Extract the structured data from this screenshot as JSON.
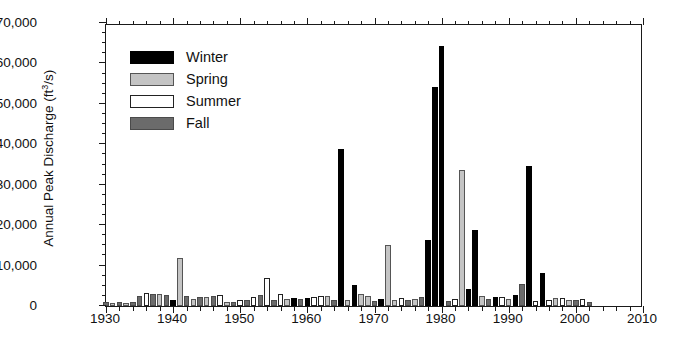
{
  "chart_data": {
    "type": "bar",
    "title": "",
    "xlabel": "",
    "ylabel": "Annual Peak Discharge (ft3/s)",
    "ylabel_main": "Annual Peak Discharge (ft",
    "ylabel_sup": "3",
    "ylabel_tail": "/s)",
    "xlim": [
      1930,
      2010
    ],
    "ylim": [
      0,
      70000
    ],
    "ytick_labels": [
      "0",
      "10,000",
      "20,000",
      "30,000",
      "40,000",
      "50,000",
      "60,000",
      "70,000"
    ],
    "ytick_values": [
      0,
      10000,
      20000,
      30000,
      40000,
      50000,
      60000,
      70000
    ],
    "ytick_minor_step": 2500,
    "xtick_labels": [
      "1930",
      "1940",
      "1950",
      "1960",
      "1970",
      "1980",
      "1990",
      "2000",
      "2010"
    ],
    "xtick_values": [
      1930,
      1940,
      1950,
      1960,
      1970,
      1980,
      1990,
      2000,
      2010
    ],
    "xtick_minor_step": 2,
    "grid": false,
    "legend_position": "upper-left",
    "legend": [
      {
        "name": "Winter",
        "color": "#000000",
        "border": "#000000"
      },
      {
        "name": "Spring",
        "color": "#c4c4c4",
        "border": "#555555"
      },
      {
        "name": "Summer",
        "color": "#ffffff",
        "border": "#222222"
      },
      {
        "name": "Fall",
        "color": "#6b6b6b",
        "border": "#4a4a4a"
      }
    ],
    "categories": [
      1930,
      1931,
      1932,
      1933,
      1934,
      1935,
      1936,
      1937,
      1938,
      1939,
      1940,
      1941,
      1942,
      1943,
      1944,
      1945,
      1946,
      1947,
      1948,
      1949,
      1950,
      1951,
      1952,
      1953,
      1954,
      1955,
      1956,
      1957,
      1958,
      1959,
      1960,
      1961,
      1962,
      1963,
      1964,
      1965,
      1966,
      1967,
      1968,
      1969,
      1970,
      1971,
      1972,
      1973,
      1974,
      1975,
      1976,
      1977,
      1978,
      1979,
      1980,
      1981,
      1982,
      1983,
      1984,
      1985,
      1986,
      1987,
      1988,
      1989,
      1990,
      1991,
      1992,
      1993,
      1994,
      1995,
      1996,
      1997,
      1998,
      1999,
      2000,
      2001,
      2002
    ],
    "points": [
      {
        "year": 1930,
        "value": 900,
        "season": "Fall"
      },
      {
        "year": 1931,
        "value": 700,
        "season": "Spring"
      },
      {
        "year": 1932,
        "value": 900,
        "season": "Fall"
      },
      {
        "year": 1933,
        "value": 800,
        "season": "Spring"
      },
      {
        "year": 1934,
        "value": 900,
        "season": "Fall"
      },
      {
        "year": 1935,
        "value": 2600,
        "season": "Fall"
      },
      {
        "year": 1936,
        "value": 3200,
        "season": "Summer"
      },
      {
        "year": 1937,
        "value": 3000,
        "season": "Fall"
      },
      {
        "year": 1938,
        "value": 3000,
        "season": "Spring"
      },
      {
        "year": 1939,
        "value": 2700,
        "season": "Fall"
      },
      {
        "year": 1940,
        "value": 1400,
        "season": "Winter"
      },
      {
        "year": 1941,
        "value": 11800,
        "season": "Spring"
      },
      {
        "year": 1942,
        "value": 2500,
        "season": "Fall"
      },
      {
        "year": 1943,
        "value": 1700,
        "season": "Spring"
      },
      {
        "year": 1944,
        "value": 2200,
        "season": "Fall"
      },
      {
        "year": 1945,
        "value": 2200,
        "season": "Spring"
      },
      {
        "year": 1946,
        "value": 2600,
        "season": "Fall"
      },
      {
        "year": 1947,
        "value": 2800,
        "season": "Summer"
      },
      {
        "year": 1948,
        "value": 1100,
        "season": "Spring"
      },
      {
        "year": 1949,
        "value": 1000,
        "season": "Fall"
      },
      {
        "year": 1950,
        "value": 1600,
        "season": "Summer"
      },
      {
        "year": 1951,
        "value": 1500,
        "season": "Fall"
      },
      {
        "year": 1952,
        "value": 2300,
        "season": "Summer"
      },
      {
        "year": 1953,
        "value": 2700,
        "season": "Fall"
      },
      {
        "year": 1954,
        "value": 7000,
        "season": "Summer"
      },
      {
        "year": 1955,
        "value": 1400,
        "season": "Fall"
      },
      {
        "year": 1956,
        "value": 3000,
        "season": "Summer"
      },
      {
        "year": 1957,
        "value": 1700,
        "season": "Spring"
      },
      {
        "year": 1958,
        "value": 1900,
        "season": "Winter"
      },
      {
        "year": 1959,
        "value": 1800,
        "season": "Fall"
      },
      {
        "year": 1960,
        "value": 2000,
        "season": "Winter"
      },
      {
        "year": 1961,
        "value": 2200,
        "season": "Summer"
      },
      {
        "year": 1962,
        "value": 2500,
        "season": "Summer"
      },
      {
        "year": 1963,
        "value": 2400,
        "season": "Spring"
      },
      {
        "year": 1964,
        "value": 1500,
        "season": "Fall"
      },
      {
        "year": 1965,
        "value": 38800,
        "season": "Winter"
      },
      {
        "year": 1966,
        "value": 1600,
        "season": "Spring"
      },
      {
        "year": 1967,
        "value": 5200,
        "season": "Winter"
      },
      {
        "year": 1968,
        "value": 3000,
        "season": "Spring"
      },
      {
        "year": 1969,
        "value": 2500,
        "season": "Spring"
      },
      {
        "year": 1970,
        "value": 1300,
        "season": "Fall"
      },
      {
        "year": 1971,
        "value": 1800,
        "season": "Winter"
      },
      {
        "year": 1972,
        "value": 15000,
        "season": "Spring"
      },
      {
        "year": 1973,
        "value": 1600,
        "season": "Spring"
      },
      {
        "year": 1974,
        "value": 2000,
        "season": "Summer"
      },
      {
        "year": 1975,
        "value": 1500,
        "season": "Fall"
      },
      {
        "year": 1976,
        "value": 1800,
        "season": "Spring"
      },
      {
        "year": 1977,
        "value": 2300,
        "season": "Fall"
      },
      {
        "year": 1978,
        "value": 16400,
        "season": "Winter"
      },
      {
        "year": 1979,
        "value": 54100,
        "season": "Winter"
      },
      {
        "year": 1980,
        "value": 64200,
        "season": "Winter"
      },
      {
        "year": 1981,
        "value": 1200,
        "season": "Fall"
      },
      {
        "year": 1982,
        "value": 1800,
        "season": "Summer"
      },
      {
        "year": 1983,
        "value": 33600,
        "season": "Spring"
      },
      {
        "year": 1984,
        "value": 4200,
        "season": "Winter"
      },
      {
        "year": 1985,
        "value": 18700,
        "season": "Winter"
      },
      {
        "year": 1986,
        "value": 2400,
        "season": "Spring"
      },
      {
        "year": 1987,
        "value": 1700,
        "season": "Fall"
      },
      {
        "year": 1988,
        "value": 2300,
        "season": "Winter"
      },
      {
        "year": 1989,
        "value": 2200,
        "season": "Summer"
      },
      {
        "year": 1990,
        "value": 1800,
        "season": "Spring"
      },
      {
        "year": 1991,
        "value": 2800,
        "season": "Winter"
      },
      {
        "year": 1992,
        "value": 5400,
        "season": "Fall"
      },
      {
        "year": 1993,
        "value": 34700,
        "season": "Winter"
      },
      {
        "year": 1994,
        "value": 1300,
        "season": "Summer"
      },
      {
        "year": 1995,
        "value": 8200,
        "season": "Winter"
      },
      {
        "year": 1996,
        "value": 1500,
        "season": "Summer"
      },
      {
        "year": 1997,
        "value": 2000,
        "season": "Spring"
      },
      {
        "year": 1998,
        "value": 1900,
        "season": "Summer"
      },
      {
        "year": 1999,
        "value": 1500,
        "season": "Spring"
      },
      {
        "year": 2000,
        "value": 1600,
        "season": "Fall"
      },
      {
        "year": 2001,
        "value": 1800,
        "season": "Summer"
      },
      {
        "year": 2002,
        "value": 900,
        "season": "Fall"
      }
    ]
  }
}
